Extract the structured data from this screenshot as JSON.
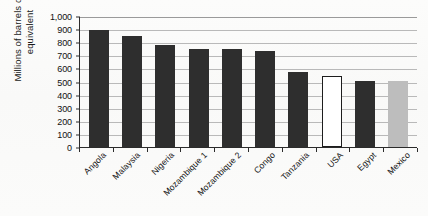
{
  "chart_data": {
    "type": "bar",
    "title": "",
    "xlabel": "",
    "ylabel": "Millions of barrels of oil equivalent",
    "ylim": [
      0,
      1000
    ],
    "ytick_labels": [
      "1,000",
      "900",
      "800",
      "700",
      "600",
      "500",
      "400",
      "300",
      "200",
      "100",
      "0"
    ],
    "ytick_values": [
      1000,
      900,
      800,
      700,
      600,
      500,
      400,
      300,
      200,
      100,
      0
    ],
    "grid": "horizontal",
    "legend": "none",
    "categories": [
      "Angola",
      "Malaysia",
      "Nigeria",
      "Mozambique 1",
      "Mozambique 2",
      "Congo",
      "Tanzania",
      "USA",
      "Egypt",
      "Mexico"
    ],
    "values": [
      895,
      850,
      780,
      750,
      745,
      735,
      575,
      545,
      505,
      505
    ],
    "bar_styles": [
      "dark",
      "dark",
      "dark",
      "dark",
      "dark",
      "dark",
      "dark",
      "white",
      "dark",
      "gray"
    ],
    "colors": {
      "dark_bar": "#2e2e2e",
      "white_bar": "#ffffff",
      "white_bar_outline": "#1d1d1d",
      "gray_bar": "#bdbdbd",
      "gridline": "#b9b9b9",
      "axis": "#2b2b2b",
      "text": "#141414",
      "background": "#fbfbfa"
    }
  }
}
